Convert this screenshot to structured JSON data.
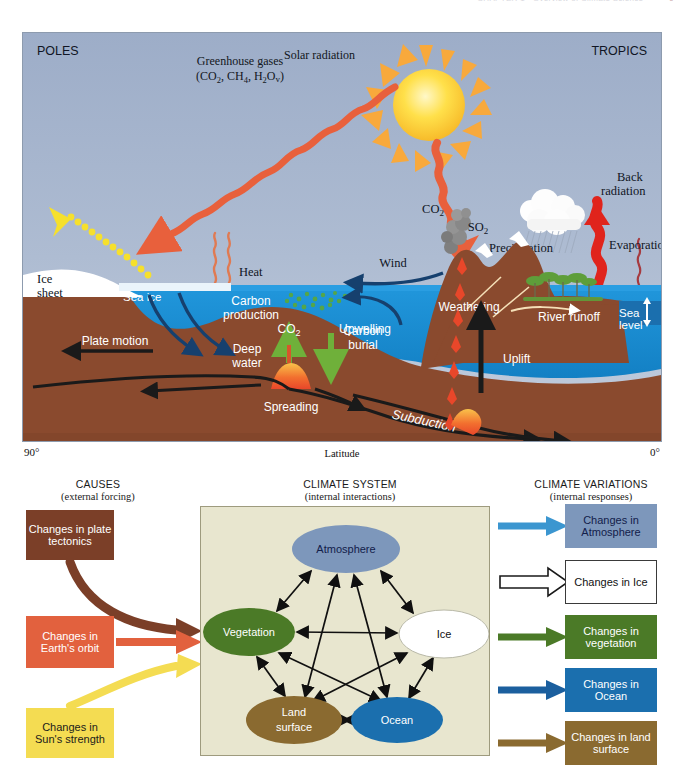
{
  "page_header": {
    "text": "CHAPTER 1 · Overview of Climate Science",
    "page_number": "9"
  },
  "upper_diagram": {
    "name": "climate-system-cross-section",
    "corner_labels": {
      "left": "POLES",
      "right": "TROPICS"
    },
    "labels": {
      "greenhouse_gases": "Greenhouse gases",
      "greenhouse_formula": "(CO2, CH4, H2Ov)",
      "solar_radiation": "Solar radiation",
      "back_radiation_line1": "Back",
      "back_radiation_line2": "radiation",
      "precipitation": "Precipitation",
      "evaporation": "Evaporation",
      "river_runoff": "River runoff",
      "sea_level_line1": "Sea",
      "sea_level_line2": "level",
      "weathering": "Weathering",
      "volcano_co2": "CO2",
      "volcano_so2": "SO2",
      "wind": "Wind",
      "heat": "Heat",
      "ice_sheet_line1": "Ice",
      "ice_sheet_line2": "sheet",
      "sea_ice": "Sea ice",
      "carbon_production_line1": "Carbon",
      "carbon_production_line2": "production",
      "upwelling": "Upwelling",
      "ocean_co2": "CO2",
      "carbon_burial_line1": "Carbon",
      "carbon_burial_line2": "burial",
      "deep_water_line1": "Deep",
      "deep_water_line2": "water",
      "plate_motion": "Plate motion",
      "spreading": "Spreading",
      "subduction": "Subduction",
      "uplift": "Uplift"
    },
    "axis": {
      "left_tick": "90°",
      "title": "Latitude",
      "right_tick": "0°"
    },
    "colors": {
      "sky": "#a8b7cf",
      "ocean": "#1c8fd6",
      "ground": "#8a4a2e",
      "ice": "#ffffff",
      "sun": "#ffd83b",
      "radiation_orange": "#e8603c",
      "reflected_yellow": "#f6e02c",
      "vegetation": "#5e9e3a",
      "magma": "#f07030"
    }
  },
  "lower_diagram": {
    "columns": [
      {
        "name": "causes",
        "title": "CAUSES",
        "subtitle": "(external forcing)"
      },
      {
        "name": "system",
        "title": "CLIMATE SYSTEM",
        "subtitle": "(internal interactions)"
      },
      {
        "name": "variations",
        "title": "CLIMATE VARIATIONS",
        "subtitle": "(internal responses)"
      }
    ],
    "causes": [
      {
        "name": "plate-tectonics",
        "label": "Changes in plate tectonics",
        "color": "#7b3f28",
        "arrow_color": "#7b3f28",
        "arrow_style": "curved"
      },
      {
        "name": "earths-orbit",
        "label": "Changes in Earth's orbit",
        "color": "#e2613e",
        "arrow_color": "#e2613e",
        "arrow_style": "straight"
      },
      {
        "name": "suns-strength",
        "label": "Changes in Sun's strength",
        "color": "#f4dc52",
        "arrow_color": "#f4dc52",
        "arrow_style": "curved"
      }
    ],
    "system_nodes": [
      {
        "name": "atmosphere",
        "label": "Atmosphere",
        "color": "#7d97bb",
        "text_color": "#12204a",
        "cx": 145,
        "cy": 42,
        "rx": 54,
        "ry": 24
      },
      {
        "name": "vegetation",
        "label": "Vegetation",
        "color": "#4b7a27",
        "text_color": "#ffffff",
        "cx": 48,
        "cy": 125,
        "rx": 46,
        "ry": 24
      },
      {
        "name": "ice",
        "label": "Ice",
        "color": "#ffffff",
        "text_color": "#111111",
        "cx": 243,
        "cy": 127,
        "rx": 46,
        "ry": 24
      },
      {
        "name": "land-surface",
        "label": "Land surface",
        "color": "#8a6a30",
        "text_color": "#ffffff",
        "cx": 93,
        "cy": 213,
        "rx": 48,
        "ry": 24
      },
      {
        "name": "ocean",
        "label": "Ocean",
        "color": "#1b6fae",
        "text_color": "#ffffff",
        "cx": 196,
        "cy": 213,
        "rx": 46,
        "ry": 23
      }
    ],
    "system_links": [
      "atmosphere-vegetation",
      "atmosphere-ice",
      "atmosphere-land-surface",
      "atmosphere-ocean",
      "vegetation-ice",
      "vegetation-land-surface",
      "vegetation-ocean",
      "ice-land-surface",
      "ice-ocean",
      "land-surface-ocean"
    ],
    "variations": [
      {
        "name": "atmosphere",
        "label": "Changes in Atmosphere",
        "color": "#7d97bb",
        "text_color": "#12204a",
        "arrow_color": "#3b96d0",
        "outline": false
      },
      {
        "name": "ice",
        "label": "Changes in Ice",
        "color": "#ffffff",
        "text_color": "#111111",
        "arrow_color": "#ffffff",
        "outline": true
      },
      {
        "name": "vegetation",
        "label": "Changes in vegetation",
        "color": "#4b7a27",
        "text_color": "#ffffff",
        "arrow_color": "#4b7a27",
        "outline": false
      },
      {
        "name": "ocean",
        "label": "Changes in Ocean",
        "color": "#1b6fae",
        "text_color": "#ffffff",
        "arrow_color": "#1b5f9e",
        "outline": false
      },
      {
        "name": "land-surface",
        "label": "Changes in land surface",
        "color": "#8a6a30",
        "text_color": "#ffffff",
        "arrow_color": "#8a6a30",
        "outline": false
      }
    ]
  }
}
